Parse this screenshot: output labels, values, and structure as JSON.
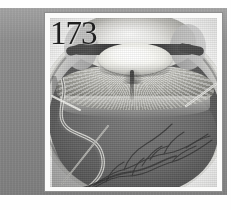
{
  "page": {
    "background_color": "#ffffff",
    "mount_color": "#8d8d8d",
    "plate_border_color": "#8e8e8e"
  },
  "plate": {
    "number": "173",
    "number_color": "#1f1f1f",
    "caption": "",
    "figure_type": "anatomical-photograph",
    "subject": "eye-cross-section"
  },
  "figure": {
    "title": "",
    "structures": [
      {
        "name": "cornea",
        "tone": "#e2e2de"
      },
      {
        "name": "anterior-chamber",
        "tone": "#f2f2ef"
      },
      {
        "name": "iris",
        "tone": "#3e3e3e"
      },
      {
        "name": "crystalline-lens",
        "tone": "#ffffff"
      },
      {
        "name": "ciliary-body",
        "tone": "#c6c6c0"
      },
      {
        "name": "vitreous-cavity",
        "tone": "#5f5f5f"
      },
      {
        "name": "retina",
        "tone": "#6c6c6c"
      },
      {
        "name": "choroid-sclera",
        "tone": "#b9b9b9"
      },
      {
        "name": "detached-retinal-fold",
        "tone": "#cfcfca"
      },
      {
        "name": "retinal-blood-vessels",
        "tone": "#3a3a3a"
      }
    ],
    "pointers": [
      {
        "id": "pointer-right",
        "label": "",
        "tone": "#e6e6e2"
      },
      {
        "id": "pointer-left-upper",
        "label": "",
        "tone": "#e9e9e5"
      },
      {
        "id": "pointer-left-lower",
        "label": "",
        "tone": "#b8b8b4"
      }
    ]
  }
}
